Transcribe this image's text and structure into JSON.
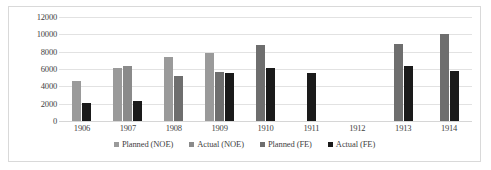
{
  "chart_data": {
    "type": "bar",
    "title": "",
    "subtitle": "",
    "xlabel": "",
    "ylabel": "",
    "grid": true,
    "legend_position": "bottom",
    "ylim": [
      0,
      12000
    ],
    "ytick_labels": [
      "12000",
      "10000",
      "8000",
      "6000",
      "4000",
      "2000",
      "0"
    ],
    "ytick_values": [
      12000,
      10000,
      8000,
      6000,
      4000,
      2000,
      0
    ],
    "categories": [
      "1906",
      "1907",
      "1908",
      "1909",
      "1910",
      "1911",
      "1912",
      "1913",
      "1914"
    ],
    "series": [
      {
        "name": "Planned (NOE)",
        "color": "#9a9a9a",
        "values": [
          4600,
          6100,
          7400,
          7900,
          null,
          null,
          null,
          null,
          null
        ]
      },
      {
        "name": "Actual (NOE)",
        "color": "#8a8a8a",
        "values": [
          null,
          6400,
          null,
          null,
          null,
          null,
          null,
          null,
          null
        ]
      },
      {
        "name": "Planned (FE)",
        "color": "#6e6e6e",
        "values": [
          null,
          null,
          5200,
          5600,
          8800,
          null,
          null,
          8900,
          10000
        ]
      },
      {
        "name": "Actual (FE)",
        "color": "#1a1a1a",
        "values": [
          2100,
          2300,
          null,
          5500,
          6100,
          5500,
          null,
          6400,
          5800
        ]
      }
    ]
  },
  "legend": {
    "items": [
      {
        "label": "Planned (NOE)",
        "color": "#9a9a9a"
      },
      {
        "label": "Actual (NOE)",
        "color": "#8a8a8a"
      },
      {
        "label": "Planned (FE)",
        "color": "#6e6e6e"
      },
      {
        "label": "Actual (FE)",
        "color": "#1a1a1a"
      }
    ]
  }
}
